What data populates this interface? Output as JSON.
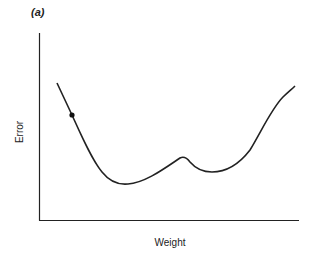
{
  "chart_data": {
    "type": "line",
    "panel_label": "(a)",
    "title": "",
    "xlabel": "Weight",
    "ylabel": "Error",
    "grid": false,
    "legend": null,
    "ticks": "none",
    "series": [
      {
        "name": "error-surface",
        "points_px": [
          [
            57,
            83
          ],
          [
            72,
            115
          ],
          [
            100,
            170
          ],
          [
            125,
            184
          ],
          [
            150,
            178
          ],
          [
            182,
            157
          ],
          [
            196,
            168
          ],
          [
            210,
            172
          ],
          [
            235,
            165
          ],
          [
            262,
            130
          ],
          [
            295,
            86
          ]
        ],
        "description": "Curve descending from high error, global minimum near left-center, small local maximum, shallow local minimum, then rising steeply at right"
      }
    ],
    "annotations": [
      {
        "type": "point",
        "label": "current weight",
        "x_px": 72,
        "y_px": 115
      }
    ],
    "features": {
      "global_minimum_px": [
        125,
        184
      ],
      "local_maximum_px": [
        182,
        157
      ],
      "local_minimum_px": [
        210,
        172
      ]
    }
  },
  "labels": {
    "panel": "(a)",
    "x": "Weight",
    "y": "Error"
  }
}
